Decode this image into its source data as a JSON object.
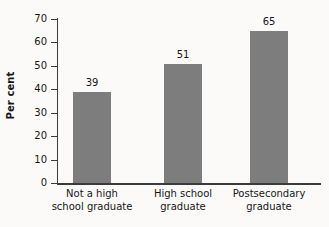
{
  "chart_data": {
    "type": "bar",
    "title": "",
    "xlabel": "",
    "ylabel": "Per cent",
    "categories": [
      "Not a high school graduate",
      "High school graduate",
      "Postsecondary graduate"
    ],
    "category_lines": [
      [
        "Not a high",
        "school graduate"
      ],
      [
        "High school",
        "graduate"
      ],
      [
        "Postsecondary",
        "graduate"
      ]
    ],
    "values": [
      39,
      51,
      65
    ],
    "value_labels": [
      "39",
      "51",
      "65"
    ],
    "ylim": [
      0,
      70
    ],
    "ytick_values": [
      0,
      10,
      20,
      30,
      40,
      50,
      60,
      70
    ],
    "ytick_labels": [
      "0",
      "10",
      "20",
      "30",
      "40",
      "50",
      "60",
      "70"
    ],
    "grid": false,
    "legend": false,
    "legend_position": "none",
    "bar_color": "#7d7d7d",
    "axis_color": "#3b3b3e",
    "text_color": "#16161a",
    "background_color": "#fbfaf8"
  }
}
